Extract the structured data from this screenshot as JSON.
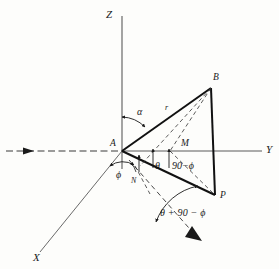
{
  "figure": {
    "kind": "3d-geometry-diagram",
    "stroke_color": "#1a1a1a",
    "axis_color": "#4a4a4a",
    "background": "#fdfdfb"
  },
  "axes": [
    {
      "name": "z-axis",
      "label": "Z",
      "x": 106,
      "y": 9
    },
    {
      "name": "y-axis",
      "label": "Y",
      "x": 266,
      "y": 144
    },
    {
      "name": "x-axis",
      "label": "X",
      "x": 33,
      "y": 252
    }
  ],
  "points": [
    {
      "name": "point-a",
      "label": "A",
      "x": 110,
      "y": 139
    },
    {
      "name": "point-b",
      "label": "B",
      "x": 213,
      "y": 73
    },
    {
      "name": "point-p",
      "label": "P",
      "x": 220,
      "y": 191
    },
    {
      "name": "point-m",
      "label": "M",
      "x": 181,
      "y": 139
    },
    {
      "name": "point-n",
      "label": "N",
      "x": 131,
      "y": 177
    }
  ],
  "angles": [
    {
      "name": "angle-alpha",
      "label": "α",
      "x": 137,
      "y": 107
    },
    {
      "name": "angle-phi",
      "label": "ϕ",
      "x": 116,
      "y": 170
    },
    {
      "name": "angle-theta",
      "label": "θ",
      "x": 155,
      "y": 161
    },
    {
      "name": "angle-90-phi",
      "label": "90−ϕ",
      "x": 169,
      "y": 161
    }
  ],
  "segments": [
    {
      "name": "segment-r",
      "label": "r",
      "x": 165,
      "y": 104
    }
  ],
  "expressions": [
    {
      "name": "expression-theta-plus-90-minus-phi",
      "label": "θ + 90 − ϕ",
      "x": 160,
      "y": 208
    }
  ]
}
